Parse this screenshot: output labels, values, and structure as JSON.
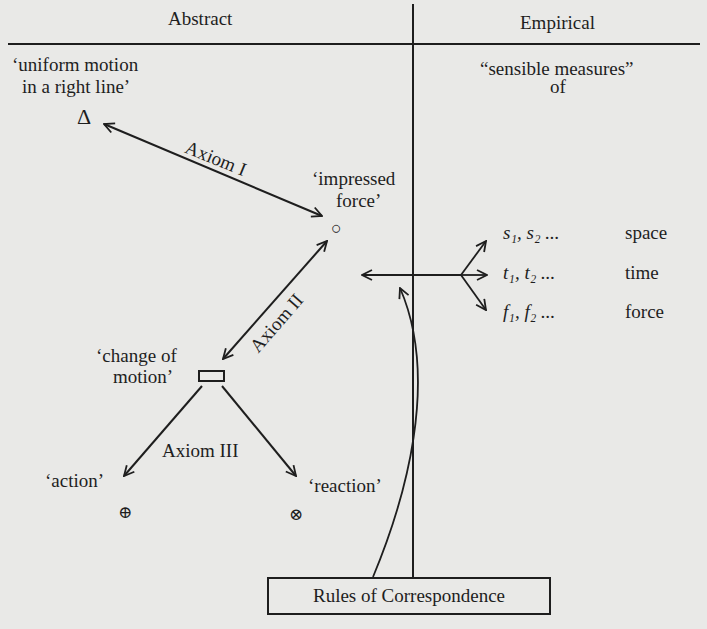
{
  "columns": {
    "left_header": "Abstract",
    "right_header": "Empirical"
  },
  "abstract_nodes": {
    "uniform_motion": {
      "line1": "‘uniform motion",
      "line2": "in a right line’",
      "symbol": "Δ"
    },
    "impressed_force": {
      "line1": "‘impressed",
      "line2": "force’",
      "symbol": "○"
    },
    "change_of_motion": {
      "line1": "‘change of",
      "line2": "motion’",
      "symbol": "▭"
    },
    "action": {
      "label": "‘action’",
      "symbol": "⊕"
    },
    "reaction": {
      "label": "‘reaction’",
      "symbol": "⊗"
    }
  },
  "axioms": {
    "axiom1": "Axiom I",
    "axiom2": "Axiom II",
    "axiom3": "Axiom III"
  },
  "empirical": {
    "heading_line1": "“sensible measures”",
    "heading_line2": "of",
    "measures": [
      {
        "var": "s",
        "terms": "s₁, s₂ ...",
        "label": "space"
      },
      {
        "var": "t",
        "terms": "t₁, t₂ ...",
        "label": "time"
      },
      {
        "var": "f",
        "terms": "f₁, f₂ ...",
        "label": "force"
      }
    ]
  },
  "rules_box": {
    "label": "Rules of Correspondence"
  },
  "colors": {
    "ink": "#1e1e1e",
    "paper": "#e9e9e7"
  }
}
